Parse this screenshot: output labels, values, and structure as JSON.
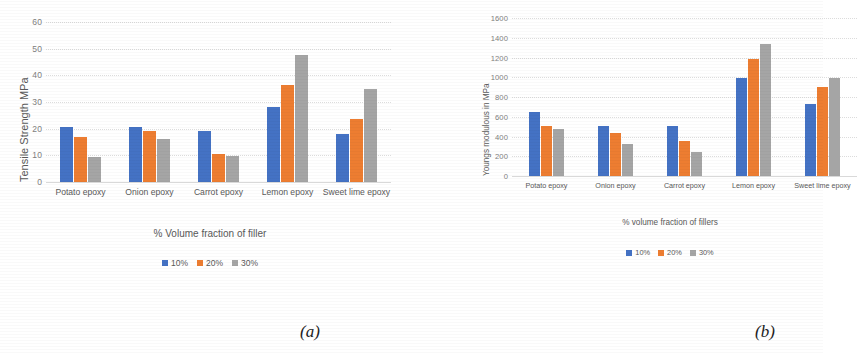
{
  "figure": {
    "panels": [
      {
        "caption": "(a)",
        "chart_data": {
          "type": "bar",
          "title": "",
          "xlabel": "% Volume fraction of filler",
          "ylabel": "Tensile Strength MPa",
          "categories": [
            "Potato epoxy",
            "Onion epoxy",
            "Carrot epoxy",
            "Lemon epoxy",
            "Sweet lime epoxy"
          ],
          "series": [
            {
              "name": "10%",
              "color": "#4472C4",
              "values": [
                20.7,
                20.6,
                19.3,
                28.0,
                18.0
              ]
            },
            {
              "name": "20%",
              "color": "#ED7D31",
              "values": [
                16.7,
                19.0,
                10.4,
                36.5,
                23.8
              ]
            },
            {
              "name": "30%",
              "color": "#A5A5A5",
              "values": [
                9.5,
                16.0,
                9.7,
                47.8,
                34.7
              ]
            }
          ],
          "ylim": [
            0,
            60
          ],
          "yticks": [
            0,
            10,
            20,
            30,
            40,
            50,
            60
          ],
          "grid": true,
          "legend_position": "bottom"
        }
      },
      {
        "caption": "(b)",
        "chart_data": {
          "type": "bar",
          "title": "",
          "xlabel": "% volume fraction of fillers",
          "ylabel": "Youngs modulous in MPa",
          "categories": [
            "Potato epoxy",
            "Onion epoxy",
            "Carrot epoxy",
            "Lemon epoxy",
            "Sweet lime epoxy"
          ],
          "series": [
            {
              "name": "10%",
              "color": "#4472C4",
              "values": [
                650,
                510,
                510,
                990,
                725
              ]
            },
            {
              "name": "20%",
              "color": "#ED7D31",
              "values": [
                505,
                435,
                350,
                1190,
                905
              ]
            },
            {
              "name": "30%",
              "color": "#A5A5A5",
              "values": [
                475,
                325,
                240,
                1340,
                990
              ]
            }
          ],
          "ylim": [
            0,
            1600
          ],
          "yticks": [
            0,
            200,
            400,
            600,
            800,
            1000,
            1200,
            1400,
            1600
          ],
          "grid": true,
          "legend_position": "bottom",
          "note": "right-most group is clipped by the figure edge"
        }
      }
    ]
  }
}
